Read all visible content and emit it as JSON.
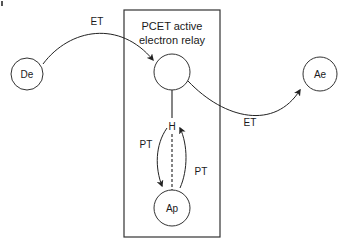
{
  "diagram": {
    "box_title_line1": "PCET active",
    "box_title_line2": "electron relay",
    "nodes": {
      "donor": "De",
      "acceptor": "Ae",
      "proton_acceptor": "Ap",
      "hydrogen": "H"
    },
    "labels": {
      "et_in": "ET",
      "et_out": "ET",
      "pt_left": "PT",
      "pt_right": "PT"
    },
    "colors": {
      "stroke": "#333333",
      "text": "#1a1a1a"
    }
  }
}
